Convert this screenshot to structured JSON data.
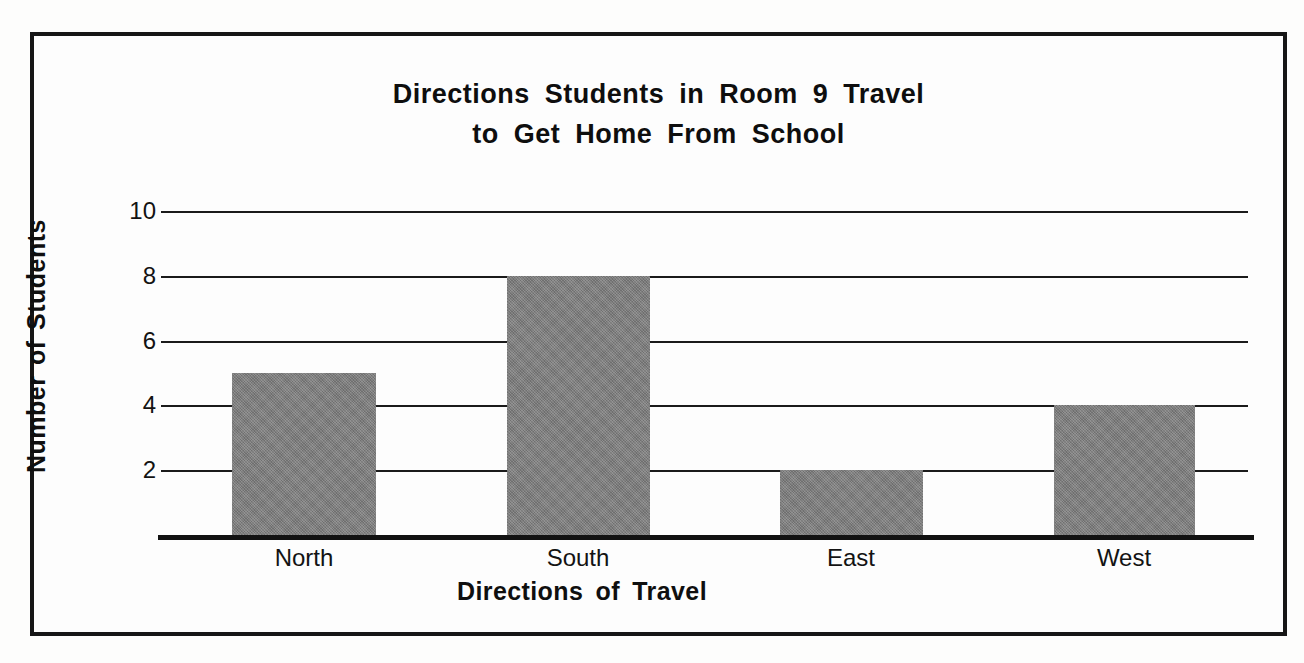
{
  "chart_data": {
    "type": "bar",
    "title": "Directions Students in Room 9 Travel to Get Home From School",
    "title_lines": [
      "Directions Students in Room 9 Travel",
      "to Get Home From School"
    ],
    "categories": [
      "North",
      "South",
      "East",
      "West"
    ],
    "values": [
      5,
      8,
      2,
      4
    ],
    "xlabel": "Directions of Travel",
    "ylabel": "Number of Students",
    "ylim": [
      0,
      10
    ],
    "ytick_labels": [
      "2",
      "4",
      "6",
      "8",
      "10"
    ],
    "ytick_values": [
      2,
      4,
      6,
      8,
      10
    ],
    "grid": true,
    "legend": false,
    "bar_color": "#7d7d7d",
    "axis_color": "#161616",
    "background_color": "#fdfdfd"
  }
}
